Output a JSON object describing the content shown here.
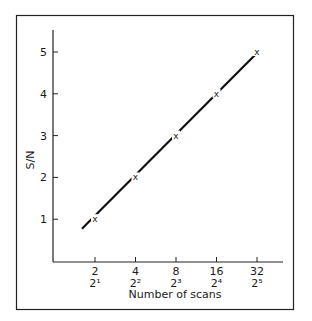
{
  "chart_data": {
    "type": "line",
    "title": "",
    "xlabel": "Number of scans",
    "ylabel": "S/N",
    "x": [
      2,
      4,
      8,
      16,
      32
    ],
    "x_tick_labels": [
      "2",
      "4",
      "8",
      "16",
      "32"
    ],
    "x_tick_sublabels": [
      "2¹",
      "2²",
      "2³",
      "2⁴",
      "2⁵"
    ],
    "x_scale": "log2",
    "y_ticks": [
      1,
      2,
      3,
      4,
      5
    ],
    "y_tick_labels": [
      "1",
      "2",
      "3",
      "4",
      "5"
    ],
    "ylim": [
      0,
      5.5
    ],
    "series": [
      {
        "name": "S/N",
        "marker": "x",
        "x": [
          2,
          4,
          8,
          16,
          32
        ],
        "values": [
          1,
          2,
          3,
          4,
          5
        ]
      }
    ],
    "fit_line": {
      "from": [
        1.6,
        0.77
      ],
      "to": [
        32,
        5
      ]
    },
    "grid": false,
    "legend": "none",
    "frame": true
  }
}
